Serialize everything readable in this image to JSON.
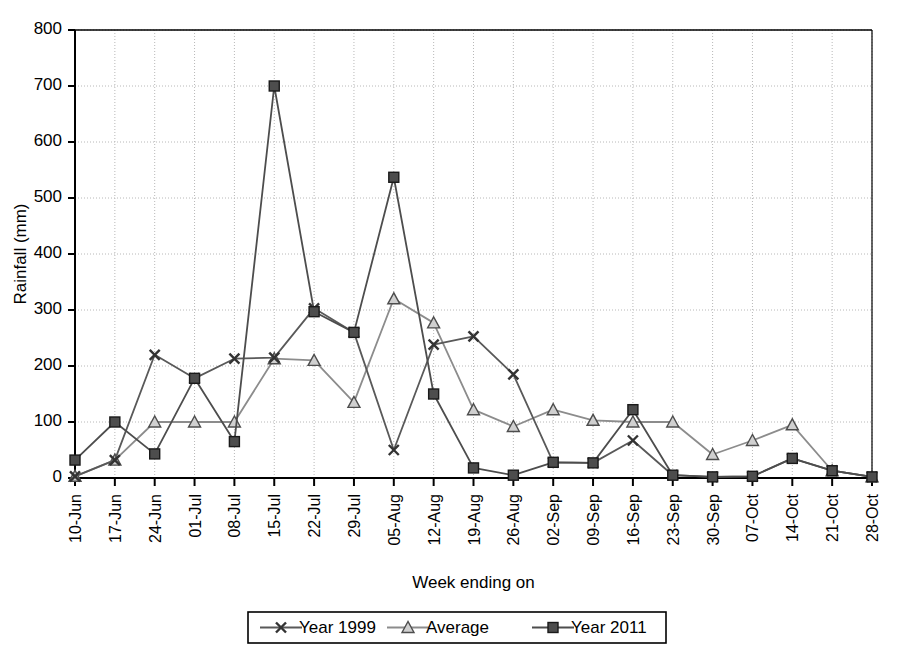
{
  "chart_data": {
    "type": "line",
    "title": "",
    "xlabel": "Week ending on",
    "ylabel": "Rainfall (mm)",
    "ylim": [
      0,
      800
    ],
    "ytick_step": 100,
    "yticks": [
      0,
      100,
      200,
      300,
      400,
      500,
      600,
      700,
      800
    ],
    "grid": true,
    "grid_axis": "both",
    "legend_position": "bottom",
    "categories": [
      "10-Jun",
      "17-Jun",
      "24-Jun",
      "01-Jul",
      "08-Jul",
      "15-Jul",
      "22-Jul",
      "29-Jul",
      "05-Aug",
      "12-Aug",
      "19-Aug",
      "26-Aug",
      "02-Sep",
      "09-Sep",
      "16-Sep",
      "23-Sep",
      "30-Sep",
      "07-Oct",
      "14-Oct",
      "21-Oct",
      "28-Oct"
    ],
    "series": [
      {
        "name": "Year 1999",
        "marker": "x",
        "color": "#595959",
        "values": [
          3,
          32,
          220,
          178,
          213,
          215,
          303,
          260,
          50,
          238,
          253,
          185,
          28,
          27,
          67,
          5,
          2,
          3,
          35,
          13,
          2
        ]
      },
      {
        "name": "Average",
        "marker": "triangle",
        "color": "#8c8c8c",
        "values": [
          3,
          32,
          100,
          100,
          100,
          213,
          210,
          135,
          320,
          277,
          122,
          92,
          122,
          103,
          100,
          100,
          42,
          67,
          95,
          13,
          2
        ]
      },
      {
        "name": "Year 2011",
        "marker": "square",
        "color": "#4d4d4d",
        "values": [
          32,
          100,
          43,
          178,
          65,
          700,
          297,
          260,
          537,
          150,
          18,
          5,
          28,
          27,
          122,
          5,
          2,
          3,
          35,
          13,
          2
        ]
      }
    ]
  },
  "axis": {
    "y_title": "Rainfall (mm)",
    "x_title": "Week ending on",
    "ytick_labels": [
      "800",
      "700",
      "600",
      "500",
      "400",
      "300",
      "200",
      "100",
      "0"
    ]
  },
  "legend": {
    "items": [
      {
        "label": "Year 1999",
        "marker": "x-marker"
      },
      {
        "label": "Average",
        "marker": "triangle-marker"
      },
      {
        "label": "Year 2011",
        "marker": "square-marker"
      }
    ]
  }
}
